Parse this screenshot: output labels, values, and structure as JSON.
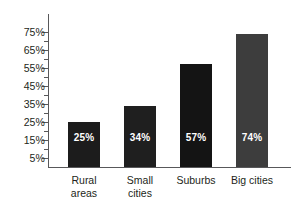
{
  "chart_data": {
    "type": "bar",
    "title": "",
    "xlabel": "",
    "ylabel": "",
    "categories": [
      "Rural areas",
      "Small cities",
      "Suburbs",
      "Big cities"
    ],
    "category_lines": [
      [
        "Rural",
        "areas"
      ],
      [
        "Small",
        "cities"
      ],
      [
        "Suburbs"
      ],
      [
        "Big cities"
      ]
    ],
    "values": [
      25,
      34,
      57,
      74
    ],
    "value_labels": [
      "25%",
      "34%",
      "57%",
      "74%"
    ],
    "ylim": [
      0,
      80
    ],
    "ytick_labels": [
      "75%",
      "65%",
      "55%",
      "45%",
      "35%",
      "25%",
      "15%",
      "5%"
    ],
    "ytick_values": [
      75,
      65,
      55,
      45,
      35,
      25,
      15,
      5
    ],
    "minor_ticks": [
      70,
      60,
      50,
      40,
      30,
      20,
      10
    ],
    "grid": false,
    "legend": false,
    "bar_colors": [
      "#1c1c1c",
      "#1f1f1f",
      "#141414",
      "#3d3d3d"
    ],
    "axis_color": "#58585a",
    "value_label_color": "#ffffff",
    "text_color": "#231f20"
  }
}
